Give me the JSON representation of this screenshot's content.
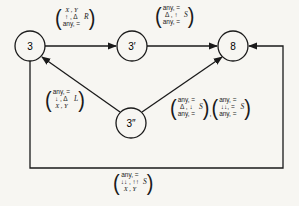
{
  "nodes": [
    {
      "id": "n3",
      "label": "3",
      "cx": 30,
      "cy": 46
    },
    {
      "id": "n3p",
      "label": "3′",
      "cx": 132,
      "cy": 46
    },
    {
      "id": "n8",
      "label": "8",
      "cx": 233,
      "cy": 46
    },
    {
      "id": "n3pp",
      "label": "3″",
      "cx": 131,
      "cy": 123
    }
  ],
  "edges": [
    {
      "from": "3",
      "to": "3′",
      "label": {
        "rows": [
          "X , Y",
          "↑ , Δ",
          "any, ="
        ],
        "tag": "R"
      }
    },
    {
      "from": "3′",
      "to": "8",
      "label": {
        "rows": [
          "any, =",
          "Δ , ↑",
          "any, ="
        ],
        "tag": "S"
      }
    },
    {
      "from": "3″",
      "to": "3",
      "label": {
        "rows": [
          "any, =",
          "↓ , Δ",
          "X , Y"
        ],
        "tag": "L"
      }
    },
    {
      "from": "3″",
      "to": "8",
      "label_a": {
        "rows": [
          "any, =",
          "Δ , ↓",
          "any, ="
        ],
        "tag": "S"
      },
      "separator": ",",
      "label_b": {
        "rows": [
          "any, =",
          "↓↓, =",
          "any, ="
        ],
        "tag": "S"
      }
    },
    {
      "from": "3",
      "to": "8",
      "via": "bottom loop",
      "label": {
        "rows": [
          "any, =",
          "↓↓ , ↑↑",
          "X , Y"
        ],
        "tag": "S"
      }
    }
  ]
}
